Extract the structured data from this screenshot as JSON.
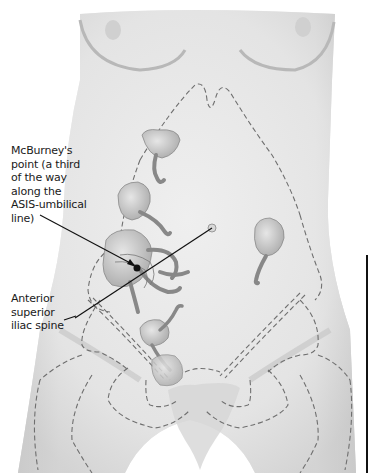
{
  "figure": {
    "colors": {
      "background": "#ffffff",
      "skin": "#e4e4e4",
      "skin_shadow": "#c9c9c9",
      "organ": "#cfcfcf",
      "organ_shadow": "#a9a9a9",
      "dashed_outline": "#6f6f6f",
      "leader_line": "#111111"
    }
  },
  "labels": [
    {
      "id": "mcburneys-point",
      "text": "McBurney's\npoint (a third\nof the way\nalong the\nASIS-umbilical\nline)"
    },
    {
      "id": "anterior-superior-iliac-spine",
      "text": "Anterior\nsuperior\niliac spine"
    }
  ],
  "markers": {
    "mcburney_point": {
      "x": 137,
      "y": 268
    },
    "umbilicus": {
      "x": 212,
      "y": 228
    },
    "asis": {
      "x": 75,
      "y": 318
    }
  }
}
